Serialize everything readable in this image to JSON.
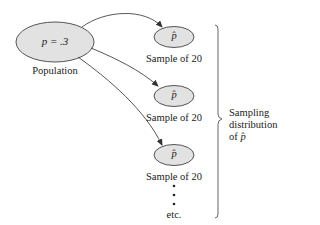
{
  "diagram": {
    "colors": {
      "ellipse_fill": "#e2e2e2",
      "stroke": "#555555",
      "text": "#222222"
    },
    "population": {
      "label": "Population",
      "value_text": "p = .3"
    },
    "samples": [
      {
        "symbol": "p̂",
        "label": "Sample of 20"
      },
      {
        "symbol": "p̂",
        "label": "Sample of 20"
      },
      {
        "symbol": "p̂",
        "label": "Sample of 20"
      }
    ],
    "continuation": {
      "dots": "⋮",
      "label": "etc."
    },
    "bracket_label": {
      "line1": "Sampling",
      "line2": "distribution",
      "line3_prefix": "of",
      "line3_symbol": "p̂"
    }
  }
}
